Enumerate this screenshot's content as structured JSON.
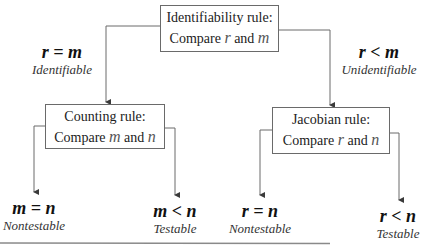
{
  "diagram": {
    "root": {
      "title": "Identifiability rule:",
      "compare_prefix": "Compare",
      "var_a": "r",
      "conj": "and",
      "var_b": "m"
    },
    "left_branch": {
      "condition": "r = m",
      "verdict": "Identifiable",
      "node": {
        "title": "Counting rule:",
        "compare_prefix": "Compare",
        "var_a": "m",
        "conj": "and",
        "var_b": "n"
      },
      "leaves": [
        {
          "condition": "m = n",
          "verdict": "Nontestable"
        },
        {
          "condition": "m < n",
          "verdict": "Testable"
        }
      ]
    },
    "right_branch": {
      "condition": "r < m",
      "verdict": "Unidentifiable",
      "node": {
        "title": "Jacobian rule:",
        "compare_prefix": "Compare",
        "var_a": "r",
        "conj": "and",
        "var_b": "n"
      },
      "leaves": [
        {
          "condition": "r = n",
          "verdict": "Nontestable"
        },
        {
          "condition": "r < n",
          "verdict": "Testable"
        }
      ]
    },
    "colors": {
      "line": "#6a6a6a",
      "text": "#1a1a1a",
      "background": "#ffffff"
    }
  }
}
